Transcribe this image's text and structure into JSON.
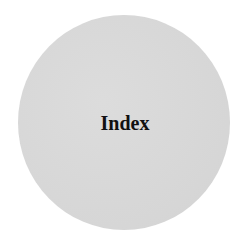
{
  "badge": {
    "label": "Index",
    "background_color": "#d9d9d9",
    "text_color": "#111111"
  }
}
